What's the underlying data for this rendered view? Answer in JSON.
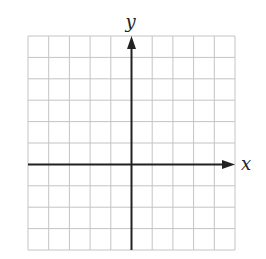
{
  "diagram": {
    "type": "coordinate-plane",
    "grid": {
      "columns": 10,
      "rows": 10,
      "left": 28,
      "top": 36,
      "right": 235,
      "bottom": 250,
      "line_color": "#c4c4c4"
    },
    "axes": {
      "color": "#222222",
      "y_axis_column": 5,
      "x_axis_row": 6,
      "x_label": "x",
      "y_label": "y"
    }
  },
  "chart_data": {
    "type": "scatter",
    "title": "",
    "xlabel": "x",
    "ylabel": "y",
    "grid": true,
    "x_gridlines": 10,
    "y_gridlines": 10,
    "series": []
  }
}
